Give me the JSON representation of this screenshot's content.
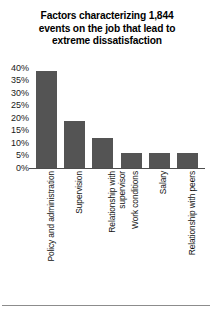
{
  "title": {
    "lines": [
      "Factors characterizing 1,844",
      "events on the job that lead to",
      "extreme dissatisfaction"
    ],
    "full": "Factors characterizing 1,844 events on the job that lead to extreme dissatisfaction"
  },
  "colors": {
    "bar": "#545454",
    "background": "#ffffff",
    "text": "#000000",
    "axis": "#4d4d4d",
    "rule": "#8c8c8c"
  },
  "chart_data": {
    "type": "bar",
    "title": "Factors characterizing 1,844 events on the job that lead to extreme dissatisfaction",
    "xlabel": "",
    "ylabel": "",
    "ylim": [
      0,
      40
    ],
    "grid": false,
    "legend": false,
    "yticks": [
      0,
      5,
      10,
      15,
      20,
      25,
      30,
      35,
      40
    ],
    "ytick_labels": [
      "0%",
      "5%",
      "10%",
      "15%",
      "20%",
      "25%",
      "30%",
      "35%",
      "40%"
    ],
    "categories": [
      "Policy and administration",
      "Supervision",
      "Relationship with supervisor",
      "Work conditions",
      "Salary",
      "Relationship with peers"
    ],
    "category_lines": [
      [
        "Policy and administration"
      ],
      [
        "Supervision"
      ],
      [
        "Relationship with",
        "supervisor"
      ],
      [
        "Work conditions"
      ],
      [
        "Salary"
      ],
      [
        "Relationship with peers"
      ]
    ],
    "values": [
      39,
      19,
      12,
      6,
      6,
      6
    ],
    "value_labels": [
      "39%",
      "19%",
      "12%",
      "6%",
      "6%",
      "6%"
    ]
  }
}
